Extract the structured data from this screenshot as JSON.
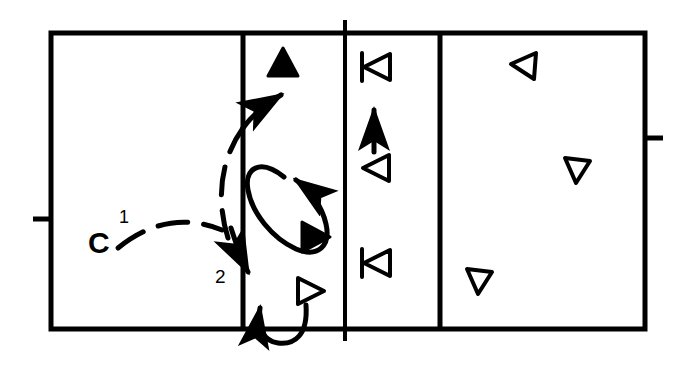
{
  "figure": {
    "title": "",
    "type": "volleyball-court-movement-diagram",
    "background_color": "#ffffff",
    "ink_color": "#000000",
    "width": 680,
    "height": 366
  },
  "labels": [
    {
      "id": "player-c",
      "text": "C",
      "x": 88,
      "y": 228,
      "style": "bold",
      "font_size": 30
    },
    {
      "id": "path-number-1",
      "text": "1",
      "x": 119,
      "y": 208,
      "style": "normal",
      "font_size": 18
    },
    {
      "id": "path-number-2",
      "text": "2",
      "x": 215,
      "y": 267,
      "style": "normal",
      "font_size": 19
    }
  ],
  "court": {
    "outer_rect": {
      "x": 51,
      "y": 33,
      "width": 594,
      "height": 296
    },
    "vertical_lines": [
      {
        "id": "attack-line-left",
        "x": 243,
        "y1": 33,
        "y2": 329
      },
      {
        "id": "center-line",
        "x": 345,
        "y1": 20,
        "y2": 341
      },
      {
        "id": "attack-line-right",
        "x": 440,
        "y1": 33,
        "y2": 329
      }
    ],
    "side_ticks": [
      {
        "id": "left-antenna-tick",
        "x1": 34,
        "x2": 51,
        "y": 219
      },
      {
        "id": "right-antenna-tick",
        "x1": 645,
        "x2": 662,
        "y": 138
      }
    ],
    "line_width": 5
  },
  "markers": [
    {
      "id": "marker-filled-up",
      "shape": "triangle",
      "fill": "solid",
      "direction": "up",
      "x": 283,
      "y": 62,
      "size": 26
    },
    {
      "id": "marker-filled-right",
      "shape": "triangle",
      "fill": "solid",
      "direction": "right",
      "x": 315,
      "y": 237,
      "size": 26
    },
    {
      "id": "marker-hollow-right",
      "shape": "triangle",
      "fill": "hollow",
      "direction": "right",
      "x": 310,
      "y": 291,
      "size": 24
    },
    {
      "id": "marker-hollow-left-bar-top",
      "shape": "triangle-with-bar",
      "fill": "hollow",
      "direction": "left",
      "x": 377,
      "y": 67,
      "size": 24
    },
    {
      "id": "marker-hollow-left-mid",
      "shape": "triangle",
      "fill": "hollow",
      "direction": "left",
      "x": 377,
      "y": 168,
      "size": 24
    },
    {
      "id": "marker-hollow-left-bar-bottom",
      "shape": "triangle-with-bar",
      "fill": "hollow",
      "direction": "left",
      "x": 377,
      "y": 263,
      "size": 24
    },
    {
      "id": "marker-hollow-backrow-1",
      "shape": "triangle",
      "fill": "hollow",
      "direction": "left",
      "x": 524,
      "y": 66,
      "size": 24
    },
    {
      "id": "marker-hollow-backrow-2",
      "shape": "triangle",
      "fill": "hollow",
      "direction": "downleft",
      "x": 577,
      "y": 165,
      "size": 24
    },
    {
      "id": "marker-hollow-backrow-3",
      "shape": "triangle",
      "fill": "hollow",
      "direction": "down",
      "x": 479,
      "y": 279,
      "size": 24
    }
  ],
  "paths": [
    {
      "id": "path-1-dashed-run",
      "style": "dashed",
      "from": "C",
      "to": "front-court-up-right",
      "arrowhead": "open"
    },
    {
      "id": "path-1-dashed-arc-up",
      "style": "dashed",
      "arrowhead": "open",
      "direction": "up-right"
    },
    {
      "id": "path-2-dashed-down",
      "style": "dashed",
      "arrowhead": "open",
      "direction": "down-right"
    },
    {
      "id": "loop-arrow",
      "style": "solid",
      "shape": "ellipse-loop",
      "arrowhead": "solid",
      "direction": "down-right"
    },
    {
      "id": "bottom-u-arrow",
      "style": "solid",
      "shape": "u-turn",
      "arrowhead": "solid",
      "direction": "up"
    },
    {
      "id": "column3-up-arrow",
      "style": "solid",
      "shape": "straight",
      "arrowhead": "solid",
      "direction": "up"
    }
  ]
}
